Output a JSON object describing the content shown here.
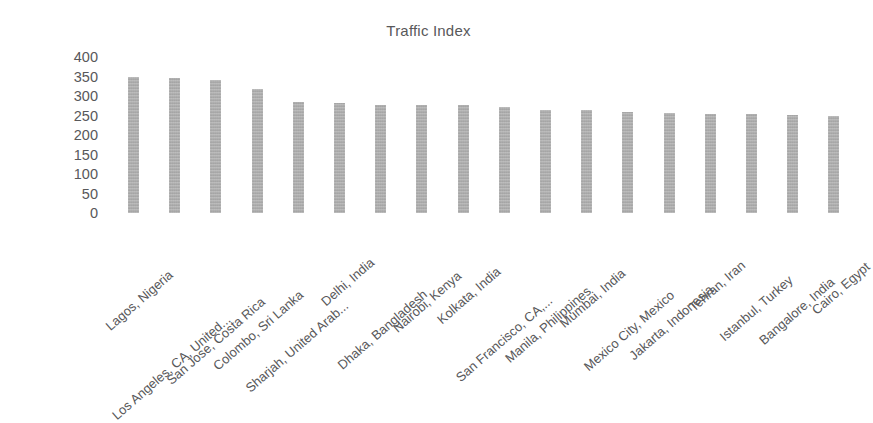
{
  "chart_data": {
    "type": "bar",
    "title": "Traffic Index",
    "xlabel": "",
    "ylabel": "",
    "ylim": [
      0,
      400
    ],
    "ytick_step": 50,
    "yticks": [
      400,
      350,
      300,
      250,
      200,
      150,
      100,
      50,
      0
    ],
    "grid": false,
    "legend": null,
    "bar_color": "#a9a9a9",
    "text_color": "#58585a",
    "xtick_rotation": -41,
    "categories": [
      "Lagos, Nigeria",
      "Los Angeles, CA, United...",
      "San Jose, Costa Rica",
      "Colombo, Sri Lanka",
      "Sharjah, United Arab...",
      "Delhi, India",
      "Dhaka, Bangladesh",
      "Nairobi, Kenya",
      "Kolkata, India",
      "San Francisco, CA,...",
      "Manila, Philippines",
      "Mumbai, India",
      "Mexico City, Mexico",
      "Jakarta, Indonesia",
      "Tehran, Iran",
      "Istanbul, Turkey",
      "Bangalore, India",
      "Cairo, Egypt"
    ],
    "values": [
      350,
      345,
      340,
      317,
      285,
      282,
      278,
      277,
      277,
      272,
      265,
      263,
      259,
      257,
      255,
      253,
      252,
      250
    ]
  }
}
